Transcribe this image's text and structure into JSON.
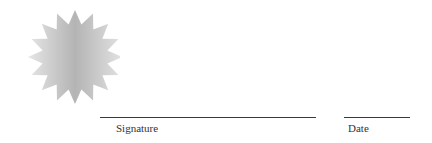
{
  "seal": {
    "icon": "starburst-seal-icon",
    "points": 16,
    "colors": {
      "center": "#b8b8b8",
      "edge": "#e4e4e4"
    }
  },
  "signature": {
    "label": "Signature"
  },
  "date": {
    "label": "Date"
  },
  "colors": {
    "line": "#3a3a3a",
    "text": "#333333",
    "background": "#ffffff"
  }
}
